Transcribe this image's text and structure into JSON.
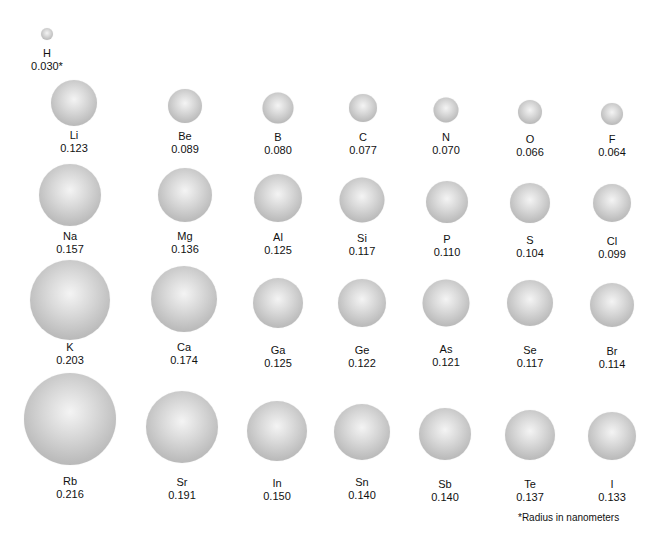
{
  "footnote": "*Radius in nanometers",
  "elements": [
    {
      "symbol": "H",
      "radius": "0.030*",
      "x": 47,
      "y": 34,
      "d": 12,
      "ly": 47
    },
    {
      "symbol": "Li",
      "radius": "0.123",
      "x": 74,
      "y": 103,
      "d": 46,
      "ly": 129
    },
    {
      "symbol": "Be",
      "radius": "0.089",
      "x": 185,
      "y": 106,
      "d": 34,
      "ly": 130
    },
    {
      "symbol": "B",
      "radius": "0.080",
      "x": 278,
      "y": 108,
      "d": 31,
      "ly": 131
    },
    {
      "symbol": "C",
      "radius": "0.077",
      "x": 363,
      "y": 108,
      "d": 28,
      "ly": 131
    },
    {
      "symbol": "N",
      "radius": "0.070",
      "x": 446,
      "y": 110,
      "d": 25,
      "ly": 131
    },
    {
      "symbol": "O",
      "radius": "0.066",
      "x": 530,
      "y": 112,
      "d": 24,
      "ly": 133
    },
    {
      "symbol": "F",
      "radius": "0.064",
      "x": 612,
      "y": 114,
      "d": 22,
      "ly": 133
    },
    {
      "symbol": "Na",
      "radius": "0.157",
      "x": 70,
      "y": 195,
      "d": 62,
      "ly": 230
    },
    {
      "symbol": "Mg",
      "radius": "0.136",
      "x": 185,
      "y": 195,
      "d": 54,
      "ly": 230
    },
    {
      "symbol": "Al",
      "radius": "0.125",
      "x": 278,
      "y": 198,
      "d": 48,
      "ly": 231
    },
    {
      "symbol": "Si",
      "radius": "0.117",
      "x": 362,
      "y": 200,
      "d": 45,
      "ly": 232
    },
    {
      "symbol": "P",
      "radius": "0.110",
      "x": 447,
      "y": 202,
      "d": 42,
      "ly": 233
    },
    {
      "symbol": "S",
      "radius": "0.104",
      "x": 530,
      "y": 203,
      "d": 40,
      "ly": 234
    },
    {
      "symbol": "Cl",
      "radius": "0.099",
      "x": 612,
      "y": 203,
      "d": 38,
      "ly": 235
    },
    {
      "symbol": "K",
      "radius": "0.203",
      "x": 70,
      "y": 300,
      "d": 80,
      "ly": 341
    },
    {
      "symbol": "Ca",
      "radius": "0.174",
      "x": 184,
      "y": 299,
      "d": 66,
      "ly": 341
    },
    {
      "symbol": "Ga",
      "radius": "0.125",
      "x": 278,
      "y": 303,
      "d": 50,
      "ly": 344
    },
    {
      "symbol": "Ge",
      "radius": "0.122",
      "x": 362,
      "y": 303,
      "d": 48,
      "ly": 344
    },
    {
      "symbol": "As",
      "radius": "0.121",
      "x": 446,
      "y": 303,
      "d": 47,
      "ly": 343
    },
    {
      "symbol": "Se",
      "radius": "0.117",
      "x": 530,
      "y": 303,
      "d": 46,
      "ly": 344
    },
    {
      "symbol": "Br",
      "radius": "0.114",
      "x": 612,
      "y": 305,
      "d": 44,
      "ly": 345
    },
    {
      "symbol": "Rb",
      "radius": "0.216",
      "x": 70,
      "y": 419,
      "d": 92,
      "ly": 475
    },
    {
      "symbol": "Sr",
      "radius": "0.191",
      "x": 182,
      "y": 427,
      "d": 72,
      "ly": 476
    },
    {
      "symbol": "In",
      "radius": "0.150",
      "x": 277,
      "y": 431,
      "d": 60,
      "ly": 477
    },
    {
      "symbol": "Sn",
      "radius": "0.140",
      "x": 362,
      "y": 432,
      "d": 56,
      "ly": 476
    },
    {
      "symbol": "Sb",
      "radius": "0.140",
      "x": 445,
      "y": 434,
      "d": 52,
      "ly": 478
    },
    {
      "symbol": "Te",
      "radius": "0.137",
      "x": 530,
      "y": 435,
      "d": 50,
      "ly": 478
    },
    {
      "symbol": "I",
      "radius": "0.133",
      "x": 612,
      "y": 436,
      "d": 48,
      "ly": 478
    }
  ]
}
